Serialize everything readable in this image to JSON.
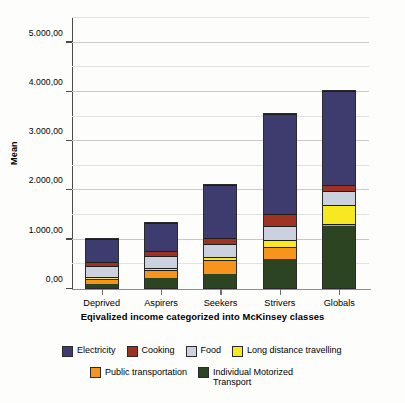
{
  "chart_data": {
    "type": "bar",
    "subtype": "stacked-bar",
    "title": "",
    "xlabel": "Eqivalized income categorized into McKinsey classes",
    "ylabel": "Mean",
    "categories": [
      "Deprived",
      "Aspirers",
      "Seekers",
      "Strivers",
      "Globals"
    ],
    "ylim": [
      0,
      5500
    ],
    "ytick_values": [
      0,
      1000,
      2000,
      3000,
      4000,
      5000
    ],
    "ytick_labels": [
      "0,00",
      "1.000,00",
      "2.000,00",
      "3.000,00",
      "4.000,00",
      "5.000,00"
    ],
    "minor_gridline_interval": 500,
    "grid": true,
    "legend_position": "bottom",
    "number_format": "european (dot thousands, comma decimals)",
    "stack_order_bottom_to_top": [
      "Individual Motorized Transport",
      "Public transportation",
      "Long distance travelling",
      "Food",
      "Cooking",
      "Electricity"
    ],
    "series": [
      {
        "name": "Individual Motorized Transport",
        "color": "#2d4423",
        "values": [
          90,
          210,
          300,
          600,
          1270
        ]
      },
      {
        "name": "Public transportation",
        "color": "#f6941e",
        "values": [
          110,
          160,
          280,
          250,
          40
        ]
      },
      {
        "name": "Long distance travelling",
        "color": "#f7e822",
        "values": [
          40,
          50,
          70,
          130,
          400
        ]
      },
      {
        "name": "Food",
        "color": "#ccd1e0",
        "values": [
          230,
          240,
          270,
          300,
          270
        ]
      },
      {
        "name": "Cooking",
        "color": "#9e3322",
        "values": [
          80,
          110,
          120,
          240,
          130
        ]
      },
      {
        "name": "Electricity",
        "color": "#3e3c6e",
        "values": [
          480,
          600,
          1090,
          2050,
          1930
        ]
      }
    ],
    "totals": [
      1030,
      1370,
      2130,
      3570,
      4040
    ]
  },
  "legend": {
    "items": [
      {
        "label": "Electricity",
        "color": "#3e3c6e"
      },
      {
        "label": "Cooking",
        "color": "#9e3322"
      },
      {
        "label": "Food",
        "color": "#ccd1e0"
      },
      {
        "label": "Long distance travelling",
        "color": "#f7e822"
      },
      {
        "label": "Public transportation",
        "color": "#f6941e"
      },
      {
        "label": "Individual Motorized\nTransport",
        "color": "#2d4423"
      }
    ]
  }
}
